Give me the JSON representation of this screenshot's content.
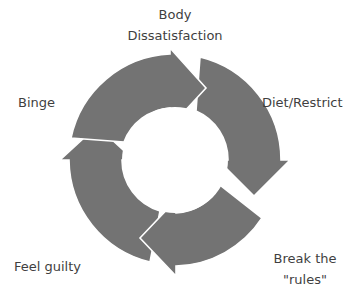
{
  "diagram": {
    "type": "cycle",
    "direction": "clockwise",
    "ring_color": "#737373",
    "separator_color": "#ffffff",
    "stages": [
      {
        "id": "body",
        "label_lines": [
          "Body",
          "Dissatisfaction"
        ]
      },
      {
        "id": "diet",
        "label_lines": [
          "Diet/Restrict"
        ]
      },
      {
        "id": "break",
        "label_lines": [
          "Break the",
          "\"rules\""
        ]
      },
      {
        "id": "guilty",
        "label_lines": [
          "Feel guilty"
        ]
      },
      {
        "id": "binge",
        "label_lines": [
          "Binge"
        ]
      }
    ]
  }
}
